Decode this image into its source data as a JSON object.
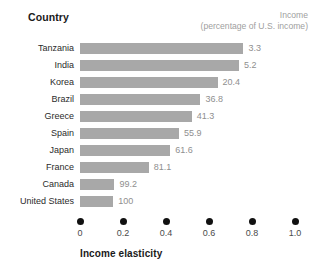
{
  "header": {
    "country_label": "Country",
    "income_label_line1": "Income",
    "income_label_line2": "(percentage of U.S. income)"
  },
  "axis": {
    "title": "Income elasticity",
    "ticks": [
      "0",
      "0.2",
      "0.4",
      "0.6",
      "0.8",
      "1.0"
    ]
  },
  "colors": {
    "bar": "#a8a8a8",
    "value_text": "#8f8f8f",
    "header_income_text": "#a0a0a0",
    "label_text": "#2b2b2b",
    "tick_dot": "#111111",
    "background": "#ffffff"
  },
  "chart_data": {
    "type": "bar",
    "orientation": "horizontal",
    "title": "",
    "xlabel": "Income elasticity",
    "ylabel": "Country",
    "xlim": [
      0,
      1.0
    ],
    "xticks": [
      0,
      0.2,
      0.4,
      0.6,
      0.8,
      1.0
    ],
    "grid": false,
    "legend": false,
    "categories": [
      "Tanzania",
      "India",
      "Korea",
      "Brazil",
      "Greece",
      "Spain",
      "Japan",
      "France",
      "Canada",
      "United States"
    ],
    "values": [
      0.76,
      0.74,
      0.64,
      0.56,
      0.52,
      0.46,
      0.42,
      0.32,
      0.16,
      0.155
    ],
    "data_labels": [
      "3.3",
      "5.2",
      "20.4",
      "36.8",
      "41.3",
      "55.9",
      "61.6",
      "81.1",
      "99.2",
      "100"
    ],
    "data_label_name": "Income (percentage of U.S. income)",
    "rows": [
      {
        "country": "Tanzania",
        "elasticity": 0.76,
        "income_pct": "3.3"
      },
      {
        "country": "India",
        "elasticity": 0.74,
        "income_pct": "5.2"
      },
      {
        "country": "Korea",
        "elasticity": 0.64,
        "income_pct": "20.4"
      },
      {
        "country": "Brazil",
        "elasticity": 0.56,
        "income_pct": "36.8"
      },
      {
        "country": "Greece",
        "elasticity": 0.52,
        "income_pct": "41.3"
      },
      {
        "country": "Spain",
        "elasticity": 0.46,
        "income_pct": "55.9"
      },
      {
        "country": "Japan",
        "elasticity": 0.42,
        "income_pct": "61.6"
      },
      {
        "country": "France",
        "elasticity": 0.32,
        "income_pct": "81.1"
      },
      {
        "country": "Canada",
        "elasticity": 0.16,
        "income_pct": "99.2"
      },
      {
        "country": "United States",
        "elasticity": 0.155,
        "income_pct": "100"
      }
    ]
  }
}
